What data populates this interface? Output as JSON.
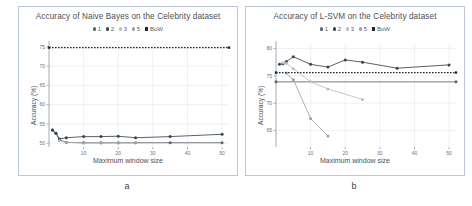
{
  "figure": {
    "caption_a": "a",
    "caption_b": "b"
  },
  "colors": {
    "series1": "#5b6570",
    "series2": "#3d434a",
    "series3": "#b9bec4",
    "series5": "#9aa0a6",
    "bow": "#23272b",
    "grid": "#e3e7ee",
    "axis": "#9aa1ab",
    "panel_border": "#b9c4d6",
    "title": "#4a4f57"
  },
  "legend": {
    "items": [
      {
        "label": "1",
        "marker": "dot",
        "color": "#5b6570"
      },
      {
        "label": "2",
        "marker": "dot",
        "color": "#3d434a"
      },
      {
        "label": "3",
        "marker": "dot",
        "color": "#b9bec4"
      },
      {
        "label": "5",
        "marker": "dot",
        "color": "#9aa0a6"
      },
      {
        "label": "BoW",
        "marker": "square",
        "color": "#23272b"
      }
    ]
  },
  "chart_data": [
    {
      "id": "naive-bayes",
      "type": "line",
      "title": "Accuracy of Naive Bayes on the Celebrity dataset",
      "xlabel": "Maximum window size",
      "ylabel": "Accuracy (%)",
      "xlim": [
        0,
        52
      ],
      "ylim": [
        49,
        76
      ],
      "xticks": [
        10,
        20,
        30,
        40,
        50
      ],
      "yticks": [
        50,
        55,
        60,
        65,
        70,
        75
      ],
      "grid": true,
      "legend_position": "top-center",
      "series": [
        {
          "name": "1",
          "x": [
            1,
            2,
            3,
            5,
            10,
            15,
            20,
            25,
            35,
            50
          ],
          "y": [
            53.4,
            52.6,
            50.9,
            50.2,
            50.1,
            50.1,
            50.1,
            50.1,
            50.1,
            50.1
          ]
        },
        {
          "name": "2",
          "x": [
            1,
            2,
            3,
            5,
            10,
            15,
            20,
            25,
            35,
            50
          ],
          "y": [
            53.4,
            52.6,
            51.1,
            51.4,
            51.7,
            51.7,
            51.8,
            51.4,
            51.7,
            52.3
          ]
        },
        {
          "name": "3",
          "x": [
            3,
            5,
            10,
            15,
            20,
            25
          ],
          "y": [
            50.6,
            50.2,
            50.1,
            50.1,
            50.1,
            50.1
          ]
        },
        {
          "name": "5",
          "x": [
            5,
            10,
            15,
            20,
            25
          ],
          "y": [
            50.2,
            50.1,
            50.1,
            50.1,
            50.1
          ]
        },
        {
          "name": "BoW",
          "x": [
            0,
            52
          ],
          "y": [
            74.8,
            74.8
          ],
          "style": "dotted"
        }
      ]
    },
    {
      "id": "l-svm",
      "type": "line",
      "title": "Accuracy of L-SVM on the Celebrity dataset",
      "xlabel": "Maximum window size",
      "ylabel": "Accuracy (%)",
      "xlim": [
        0,
        52
      ],
      "ylim": [
        62,
        81
      ],
      "xticks": [
        10,
        20,
        30,
        40,
        50
      ],
      "yticks": [
        65,
        70,
        75,
        80
      ],
      "grid": true,
      "legend_position": "top-center",
      "series": [
        {
          "name": "1",
          "x": [
            0,
            52
          ],
          "y": [
            73.9,
            73.9
          ],
          "style": "solid-flat"
        },
        {
          "name": "2",
          "x": [
            1,
            2,
            3,
            5,
            10,
            15,
            20,
            25,
            35,
            50
          ],
          "y": [
            77.1,
            77.2,
            77.6,
            78.5,
            77.1,
            76.6,
            77.9,
            77.5,
            76.4,
            77.0
          ]
        },
        {
          "name": "3",
          "x": [
            2,
            3,
            5,
            10,
            15,
            25
          ],
          "y": [
            77.4,
            77.3,
            76.3,
            73.9,
            72.6,
            70.7
          ]
        },
        {
          "name": "5",
          "x": [
            3,
            5,
            10,
            15
          ],
          "y": [
            75.5,
            74.3,
            67.2,
            64.0
          ]
        },
        {
          "name": "BoW",
          "x": [
            0,
            52
          ],
          "y": [
            75.6,
            75.6
          ],
          "style": "dotted"
        }
      ]
    }
  ]
}
